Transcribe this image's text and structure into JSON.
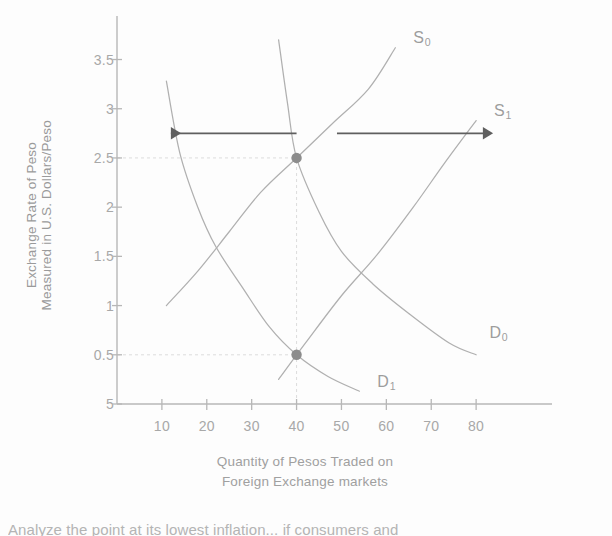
{
  "chart_data": {
    "type": "line",
    "title": "",
    "xlabel_lines": [
      "Quantity of Pesos Traded on",
      "Foreign Exchange markets"
    ],
    "ylabel_lines": [
      "Exchange Rate of Peso",
      "Measured in U.S. Dollars/Peso"
    ],
    "xlabel": "Quantity of Pesos Traded on Foreign Exchange markets",
    "ylabel": "Exchange Rate of Peso Measured in U.S. Dollars/Peso",
    "xticks": [
      10,
      20,
      30,
      40,
      50,
      60,
      70,
      80
    ],
    "xtick_labels": [
      "10",
      "20",
      "30",
      "40",
      "50",
      "60",
      "70",
      "80"
    ],
    "yticks": [
      0,
      0.5,
      1,
      1.5,
      2,
      2.5,
      3,
      3.5
    ],
    "ytick_labels": [
      "5",
      "0.5",
      "1",
      "1.5",
      "2",
      "2.5",
      "3",
      "3.5"
    ],
    "xlim": [
      0,
      92
    ],
    "ylim": [
      0,
      3.8
    ],
    "grid": false,
    "guide_lines": [
      {
        "name": "horizontal-guide-2.5",
        "y": 2.5,
        "x_from": 0,
        "x_to": 40,
        "style": "dashed"
      },
      {
        "name": "horizontal-guide-0.5",
        "y": 0.5,
        "x_from": 0,
        "x_to": 40,
        "style": "dashed"
      },
      {
        "name": "vertical-guide-40",
        "x": 40,
        "y_from": 0,
        "y_to": 2.5,
        "style": "dashed"
      }
    ],
    "series": [
      {
        "name": "S0",
        "label": "S",
        "subscript": "0",
        "kind": "supply",
        "points": [
          [
            11,
            1.0
          ],
          [
            18,
            1.35
          ],
          [
            25,
            1.75
          ],
          [
            32,
            2.15
          ],
          [
            40,
            2.5
          ],
          [
            48,
            2.85
          ],
          [
            56,
            3.2
          ],
          [
            62,
            3.62
          ]
        ],
        "label_pos": [
          66,
          3.72
        ]
      },
      {
        "name": "S1",
        "label": "S",
        "subscript": "1",
        "kind": "supply",
        "points": [
          [
            36,
            0.25
          ],
          [
            42,
            0.62
          ],
          [
            50,
            1.1
          ],
          [
            58,
            1.52
          ],
          [
            66,
            2.0
          ],
          [
            73,
            2.45
          ],
          [
            80,
            2.88
          ]
        ],
        "label_pos": [
          84,
          2.98
        ]
      },
      {
        "name": "D0",
        "label": "D",
        "subscript": "0",
        "kind": "demand",
        "points": [
          [
            36,
            3.7
          ],
          [
            38,
            3.05
          ],
          [
            40,
            2.5
          ],
          [
            45,
            1.95
          ],
          [
            50,
            1.55
          ],
          [
            57,
            1.22
          ],
          [
            65,
            0.92
          ],
          [
            74,
            0.62
          ],
          [
            80,
            0.5
          ]
        ],
        "label_pos": [
          83,
          0.72
        ]
      },
      {
        "name": "D1",
        "label": "D",
        "subscript": "1",
        "kind": "demand",
        "points": [
          [
            11,
            3.28
          ],
          [
            14,
            2.55
          ],
          [
            18,
            2.0
          ],
          [
            22,
            1.6
          ],
          [
            28,
            1.18
          ],
          [
            34,
            0.78
          ],
          [
            40,
            0.5
          ],
          [
            47,
            0.28
          ],
          [
            54,
            0.13
          ]
        ],
        "label_pos": [
          58,
          0.22
        ]
      }
    ],
    "markers": [
      {
        "name": "equilibrium-initial",
        "x": 40,
        "y": 2.5
      },
      {
        "name": "equilibrium-new",
        "x": 40,
        "y": 0.5
      }
    ],
    "annotations": [
      {
        "name": "arrow-demand-shift-left",
        "direction": "left",
        "y": 2.75,
        "x_from": 40,
        "x_to": 12
      },
      {
        "name": "arrow-supply-shift-right",
        "direction": "right",
        "y": 2.75,
        "x_from": 49,
        "x_to": 82
      }
    ],
    "colors": {
      "curve": "#b0b0b0",
      "axis": "#b7b7b7",
      "text": "#a4a4a4",
      "marker": "#8c8c8c",
      "arrow": "#5f5f5f",
      "guide": "#dcdcdc"
    }
  },
  "caption": {
    "text": "Analyze the point at its lowest inflation... if consumers and"
  }
}
